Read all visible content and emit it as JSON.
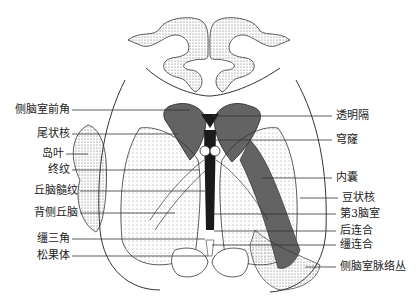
{
  "figure": {
    "colors": {
      "ink": "#222222",
      "shade": "#555555",
      "dark": "#1a1a1a",
      "background": "#ffffff"
    }
  },
  "labels_left": [
    {
      "text": "侧脑室前角",
      "y": 110
    },
    {
      "text": "尾状核",
      "y": 134
    },
    {
      "text": "岛叶",
      "y": 154
    },
    {
      "text": "终纹",
      "y": 170
    },
    {
      "text": "丘脑髓纹",
      "y": 191
    },
    {
      "text": "背侧丘脑",
      "y": 213
    },
    {
      "text": "缰三角",
      "y": 239
    },
    {
      "text": "松果体",
      "y": 256
    }
  ],
  "labels_right": [
    {
      "text": "透明隔",
      "y": 116
    },
    {
      "text": "穹窿",
      "y": 140
    },
    {
      "text": "内囊",
      "y": 178
    },
    {
      "text": "豆状核",
      "y": 198
    },
    {
      "text": "第3脑室",
      "y": 214
    },
    {
      "text": "后连合",
      "y": 231
    },
    {
      "text": "缰连合",
      "y": 245
    },
    {
      "text": "侧脑室脉络丛",
      "y": 267
    }
  ]
}
